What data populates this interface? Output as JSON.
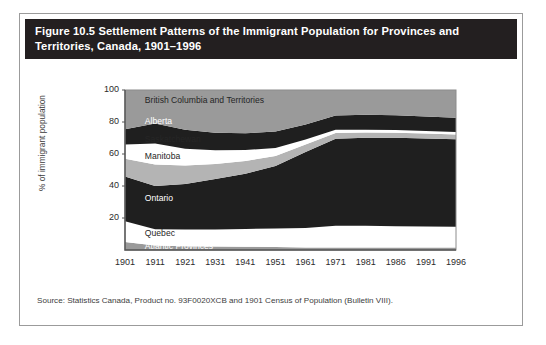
{
  "figure": {
    "title": "Figure 10.5 Settlement Patterns of the Immigrant Population for Provinces and Territories, Canada, 1901–1996",
    "source": "Source: Statistics Canada, Product no. 93F0020XCB and 1901 Census of Population (Bulletin VIII)."
  },
  "colors": {
    "header_background": "#231f20",
    "header_text": "#ffffff",
    "frame_border": "#9b9b9b",
    "plot_background": "#ffffff",
    "axis_line": "#555555",
    "dark_band": "#1f1f1f",
    "mid_gray_band": "#9a9a9a",
    "light_gray_band": "#b4b4b4",
    "white_band": "#ffffff"
  },
  "chart_data": {
    "type": "area",
    "title": "Settlement Patterns of the Immigrant Population for Provinces and Territories, Canada, 1901–1996",
    "xlabel": "",
    "ylabel": "% of immigrant population",
    "ylim": [
      0,
      100
    ],
    "yticks": [
      20,
      40,
      60,
      80,
      100
    ],
    "grid": false,
    "legend_position": "inline-labels",
    "stacked": true,
    "stack_order": "bottom-to-top",
    "x": [
      1901,
      1911,
      1921,
      1931,
      1941,
      1951,
      1961,
      1971,
      1981,
      1986,
      1991,
      1996
    ],
    "categories": [
      "1901",
      "1911",
      "1921",
      "1931",
      "1941",
      "1951",
      "1961",
      "1971",
      "1981",
      "1986",
      "1991",
      "1996"
    ],
    "series": [
      {
        "name": "Atlantic Provinces",
        "fill": "#9a9a9a",
        "label_color": "light",
        "values": [
          5.0,
          2.8,
          2.4,
          2.2,
          2.1,
          1.9,
          1.6,
          1.5,
          1.5,
          1.5,
          1.5,
          1.5
        ]
      },
      {
        "name": "Quebec",
        "fill": "#ffffff",
        "label_color": "dark",
        "values": [
          13.0,
          10.2,
          10.4,
          10.6,
          11.1,
          11.6,
          12.2,
          13.7,
          13.6,
          13.4,
          13.2,
          13.1
        ]
      },
      {
        "name": "Ontario",
        "fill": "#1f1f1f",
        "label_color": "light",
        "values": [
          28.0,
          27.0,
          28.5,
          31.5,
          34.5,
          39.0,
          47.5,
          54.3,
          55.0,
          55.2,
          55.0,
          54.6
        ]
      },
      {
        "name": "Manitoba",
        "fill": "#b4b4b4",
        "label_color": "dark",
        "values": [
          11.0,
          13.5,
          11.5,
          9.5,
          8.0,
          6.2,
          4.6,
          3.6,
          3.3,
          3.2,
          3.1,
          3.0
        ]
      },
      {
        "name": "Saskatchewan",
        "fill": "#ffffff",
        "label_color": "dark",
        "values": [
          9.0,
          13.0,
          10.5,
          8.5,
          6.8,
          5.0,
          3.2,
          2.1,
          1.8,
          1.7,
          1.6,
          1.5
        ]
      },
      {
        "name": "Alberta",
        "fill": "#1f1f1f",
        "label_color": "light",
        "values": [
          9.5,
          12.5,
          11.8,
          11.0,
          10.5,
          10.3,
          9.4,
          8.8,
          9.3,
          9.2,
          9.1,
          9.0
        ]
      },
      {
        "name": "British Columbia and Territories",
        "fill": "#9a9a9a",
        "label_color": "dark",
        "values": [
          24.5,
          21.0,
          24.9,
          26.7,
          27.0,
          26.0,
          21.5,
          16.0,
          15.5,
          15.8,
          16.5,
          17.3
        ]
      }
    ],
    "inline_labels": [
      {
        "name": "British Columbia and Territories",
        "x_pct": 6,
        "y_pct": 93
      },
      {
        "name": "Alberta",
        "x_pct": 6,
        "y_pct": 80
      },
      {
        "name": "Saskatchewan",
        "x_pct": 6,
        "y_pct": 69
      },
      {
        "name": "Manitoba",
        "x_pct": 6,
        "y_pct": 58
      },
      {
        "name": "Ontario",
        "x_pct": 6,
        "y_pct": 32
      },
      {
        "name": "Quebec",
        "x_pct": 6,
        "y_pct": 10
      },
      {
        "name": "Atlantic Provinces",
        "x_pct": 6,
        "y_pct": 2
      }
    ]
  }
}
